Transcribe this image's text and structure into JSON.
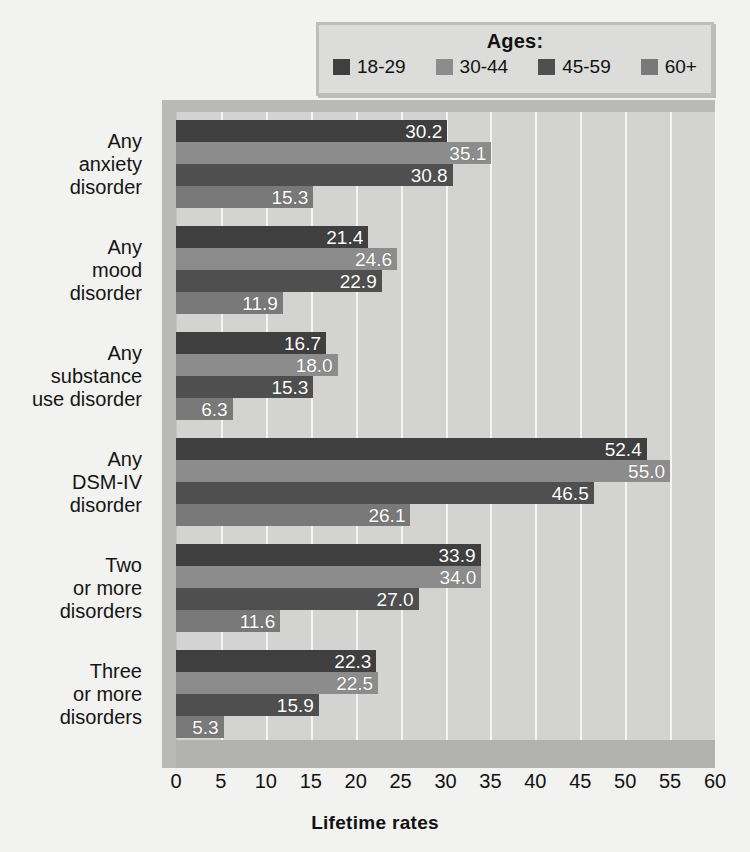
{
  "legend": {
    "title": "Ages:",
    "items": [
      {
        "label": "18-29",
        "color": "#3f3f3f",
        "swatch_name": "legend-swatch-18-29"
      },
      {
        "label": "30-44",
        "color": "#8c8c8c",
        "swatch_name": "legend-swatch-30-44"
      },
      {
        "label": "45-59",
        "color": "#4f4f4f",
        "swatch_name": "legend-swatch-45-59"
      },
      {
        "label": "60+",
        "color": "#797979",
        "swatch_name": "legend-swatch-60-plus"
      }
    ]
  },
  "chart_data": {
    "type": "bar",
    "orientation": "horizontal",
    "title": "",
    "xlabel": "Lifetime rates",
    "ylabel": "",
    "xlim": [
      0,
      60
    ],
    "xticks": [
      0,
      5,
      10,
      15,
      20,
      25,
      30,
      35,
      40,
      45,
      50,
      55,
      60
    ],
    "grid": "vertical",
    "legend_position": "top",
    "categories": [
      "Any\nanxiety\ndisorder",
      "Any\nmood\ndisorder",
      "Any\nsubstance\nuse disorder",
      "Any\nDSM-IV\ndisorder",
      "Two\nor more\ndisorders",
      "Three\nor more\ndisorders"
    ],
    "category_lines": [
      [
        "Any",
        "anxiety",
        "disorder"
      ],
      [
        "Any",
        "mood",
        "disorder"
      ],
      [
        "Any",
        "substance",
        "use disorder"
      ],
      [
        "Any",
        "DSM-IV",
        "disorder"
      ],
      [
        "Two",
        "or more",
        "disorders"
      ],
      [
        "Three",
        "or more",
        "disorders"
      ]
    ],
    "series": [
      {
        "name": "18-29",
        "color": "#3f3f3f",
        "values": [
          30.2,
          21.4,
          16.7,
          52.4,
          33.9,
          22.3
        ]
      },
      {
        "name": "30-44",
        "color": "#8c8c8c",
        "values": [
          35.1,
          24.6,
          18.0,
          55.0,
          34.0,
          22.5
        ]
      },
      {
        "name": "45-59",
        "color": "#4f4f4f",
        "values": [
          30.8,
          22.9,
          15.3,
          46.5,
          27.0,
          15.9
        ]
      },
      {
        "name": "60+",
        "color": "#797979",
        "values": [
          15.3,
          11.9,
          6.3,
          26.1,
          11.6,
          5.3
        ]
      }
    ],
    "value_labels": [
      [
        "30.2",
        "35.1",
        "30.8",
        "15.3"
      ],
      [
        "21.4",
        "24.6",
        "22.9",
        "11.9"
      ],
      [
        "16.7",
        "18.0",
        "15.3",
        "6.3"
      ],
      [
        "52.4",
        "55.0",
        "46.5",
        "26.1"
      ],
      [
        "33.9",
        "34.0",
        "27.0",
        "11.6"
      ],
      [
        "22.3",
        "22.5",
        "15.9",
        "5.3"
      ]
    ]
  },
  "axis": {
    "x_title": "Lifetime rates"
  },
  "colors": {
    "plot_background": "#d3d3d1",
    "page_background": "#f2f2f0",
    "gridline": "#f4f4f2",
    "bevel": "#b9b9b7"
  }
}
